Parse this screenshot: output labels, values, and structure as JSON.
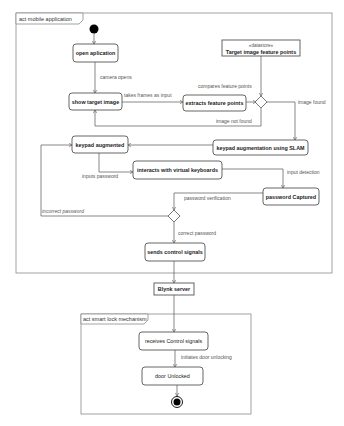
{
  "frames": {
    "mobile": {
      "label": "act mobile application"
    },
    "lock": {
      "label": "act smart lock mechanism"
    }
  },
  "actions": {
    "open_application": "open aplication",
    "show_target_image": "show target image",
    "extracts_feature_points": "extracts feature points",
    "keypad_augmentation": "keypad augmentation using SLAM",
    "keypad_augmented": "keypad augmented",
    "interacts_keyboards": "interacts with virtual keyboards",
    "password_captured": "password Captured",
    "sends_control_signals": "sends control signals",
    "receives_control_signals": "receives Control signals",
    "door_unlocked": "door Unlocked"
  },
  "datastore": {
    "stereotype": "«datastore»",
    "name": "Target image feature points"
  },
  "server": {
    "name": "Blynk server"
  },
  "edges": {
    "camera_opens": "camera opens",
    "takes_frames": "takes frames as input",
    "compares_feature_points": "compares feature points",
    "image_found": "image found",
    "image_not_found": "image not found",
    "inputs_password": "inputs password",
    "input_detection": "input detection",
    "password_verification": "password verification",
    "incorrect_password": "incorrect password",
    "correct_password": "correct password",
    "initiates_door_unlocking": "initiates door unlocking"
  },
  "colors": {
    "stroke": "#555555",
    "frame": "#8a8a8a",
    "text": "#222222"
  }
}
